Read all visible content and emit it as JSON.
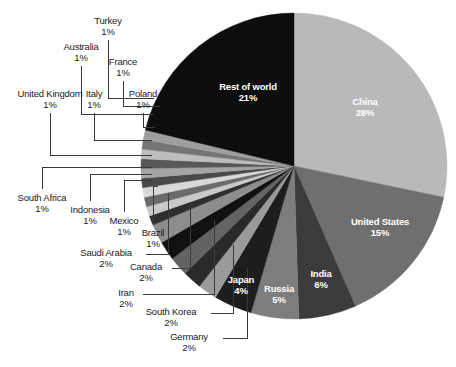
{
  "chart_data": {
    "type": "pie",
    "title": "",
    "subtitle": "",
    "xlabel": "",
    "ylabel": "",
    "legend_position": "none",
    "grid": false,
    "unit": "%",
    "start_angle_deg": 0,
    "direction": "clockwise",
    "categories": [
      "China",
      "United States",
      "India",
      "Russia",
      "Japan",
      "Germany",
      "South Korea",
      "Iran",
      "Canada",
      "Saudi Arabia",
      "Brazil",
      "Mexico",
      "Indonesia",
      "South Africa",
      "United Kingdom",
      "Italy",
      "Australia",
      "France",
      "Turkey",
      "Poland",
      "Rest of world"
    ],
    "values": [
      28,
      15,
      6,
      5,
      4,
      2,
      2,
      2,
      2,
      2,
      1,
      1,
      1,
      1,
      1,
      1,
      1,
      1,
      1,
      1,
      21
    ],
    "slices": [
      {
        "label": "China",
        "value": 28,
        "display": "28%",
        "color": "#b9b9b9",
        "label_placement": "inside",
        "text_color": "#ffffff"
      },
      {
        "label": "United States",
        "value": 15,
        "display": "15%",
        "color": "#6f6f6f",
        "label_placement": "inside",
        "text_color": "#ffffff"
      },
      {
        "label": "India",
        "value": 6,
        "display": "6%",
        "color": "#3b3b3b",
        "label_placement": "inside",
        "text_color": "#ffffff"
      },
      {
        "label": "Russia",
        "value": 5,
        "display": "5%",
        "color": "#7d7d7d",
        "label_placement": "inside",
        "text_color": "#ffffff"
      },
      {
        "label": "Japan",
        "value": 4,
        "display": "4%",
        "color": "#1d1d1d",
        "label_placement": "inside",
        "text_color": "#ffffff"
      },
      {
        "label": "Germany",
        "value": 2,
        "display": "2%",
        "color": "#9a9a9a",
        "label_placement": "callout",
        "text_color": "#1a1a1a"
      },
      {
        "label": "South Korea",
        "value": 2,
        "display": "2%",
        "color": "#2a2a2a",
        "label_placement": "callout",
        "text_color": "#1a1a1a"
      },
      {
        "label": "Iran",
        "value": 2,
        "display": "2%",
        "color": "#636363",
        "label_placement": "callout",
        "text_color": "#1a1a1a"
      },
      {
        "label": "Canada",
        "value": 2,
        "display": "2%",
        "color": "#111111",
        "label_placement": "callout",
        "text_color": "#1a1a1a"
      },
      {
        "label": "Saudi Arabia",
        "value": 2,
        "display": "2%",
        "color": "#8d8d8d",
        "label_placement": "callout",
        "text_color": "#1a1a1a"
      },
      {
        "label": "Brazil",
        "value": 1,
        "display": "1%",
        "color": "#2f2f2f",
        "label_placement": "callout",
        "text_color": "#1a1a1a"
      },
      {
        "label": "Mexico",
        "value": 1,
        "display": "1%",
        "color": "#c9c9c9",
        "label_placement": "callout",
        "text_color": "#1a1a1a"
      },
      {
        "label": "Indonesia",
        "value": 1,
        "display": "1%",
        "color": "#6b6b6b",
        "label_placement": "callout",
        "text_color": "#1a1a1a"
      },
      {
        "label": "South Africa",
        "value": 1,
        "display": "1%",
        "color": "#d8d8d8",
        "label_placement": "callout",
        "text_color": "#1a1a1a"
      },
      {
        "label": "United Kingdom",
        "value": 1,
        "display": "1%",
        "color": "#4a4a4a",
        "label_placement": "callout",
        "text_color": "#1a1a1a"
      },
      {
        "label": "Italy",
        "value": 1,
        "display": "1%",
        "color": "#a4a4a4",
        "label_placement": "callout",
        "text_color": "#1a1a1a"
      },
      {
        "label": "Australia",
        "value": 1,
        "display": "1%",
        "color": "#585858",
        "label_placement": "callout",
        "text_color": "#1a1a1a"
      },
      {
        "label": "France",
        "value": 1,
        "display": "1%",
        "color": "#bdbdbd",
        "label_placement": "callout",
        "text_color": "#1a1a1a"
      },
      {
        "label": "Turkey",
        "value": 1,
        "display": "1%",
        "color": "#757575",
        "label_placement": "callout",
        "text_color": "#1a1a1a"
      },
      {
        "label": "Poland",
        "value": 1,
        "display": "1%",
        "color": "#9e9e9e",
        "label_placement": "callout",
        "text_color": "#1a1a1a"
      },
      {
        "label": "Rest of world",
        "value": 21,
        "display": "21%",
        "color": "#0d0d0d",
        "label_placement": "inside",
        "text_color": "#ffffff"
      }
    ]
  },
  "inside_labels": {
    "china": {
      "name": "China",
      "pct": "28%"
    },
    "us": {
      "name": "United States",
      "pct": "15%"
    },
    "india": {
      "name": "India",
      "pct": "6%"
    },
    "russia": {
      "name": "Russia",
      "pct": "5%"
    },
    "japan": {
      "name": "Japan",
      "pct": "4%"
    },
    "rest": {
      "name": "Rest of world",
      "pct": "21%"
    }
  },
  "callouts": {
    "turkey": {
      "name": "Turkey",
      "pct": "1%"
    },
    "australia": {
      "name": "Australia",
      "pct": "1%"
    },
    "france": {
      "name": "France",
      "pct": "1%"
    },
    "united_kingdom": {
      "name": "United Kingdom",
      "pct": "1%"
    },
    "italy": {
      "name": "Italy",
      "pct": "1%"
    },
    "poland": {
      "name": "Poland",
      "pct": "1%"
    },
    "south_africa": {
      "name": "South Africa",
      "pct": "1%"
    },
    "indonesia": {
      "name": "Indonesia",
      "pct": "1%"
    },
    "mexico": {
      "name": "Mexico",
      "pct": "1%"
    },
    "brazil": {
      "name": "Brazil",
      "pct": "1%"
    },
    "saudi_arabia": {
      "name": "Saudi Arabia",
      "pct": "2%"
    },
    "canada": {
      "name": "Canada",
      "pct": "2%"
    },
    "iran": {
      "name": "Iran",
      "pct": "2%"
    },
    "south_korea": {
      "name": "South Korea",
      "pct": "2%"
    },
    "germany": {
      "name": "Germany",
      "pct": "2%"
    }
  },
  "style": {
    "background": "#ffffff",
    "leader_line_color": "#3a3a3a",
    "text_color": "#1a1a1a",
    "inside_text_color": "#ffffff"
  }
}
